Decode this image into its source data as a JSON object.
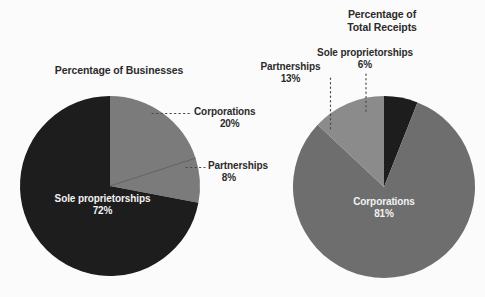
{
  "chart_data": [
    {
      "type": "pie",
      "title": "Percentage of Businesses",
      "categories": [
        "Corporations",
        "Partnerships",
        "Sole proprietorships"
      ],
      "values": [
        20,
        8,
        72
      ],
      "value_labels": [
        "20%",
        "8%",
        "72%"
      ],
      "colors": [
        "#7b7b7b",
        "#7b7b7b",
        "#1d1d1d"
      ],
      "start_angle_deg": 0,
      "direction": "clockwise",
      "legend": "none",
      "label_placement": [
        "callout",
        "callout",
        "inside"
      ]
    },
    {
      "type": "pie",
      "title": "Percentage of\nTotal Receipts",
      "categories": [
        "Sole proprietorships",
        "Corporations",
        "Partnerships"
      ],
      "values": [
        6,
        81,
        13
      ],
      "value_labels": [
        "6%",
        "81%",
        "13%"
      ],
      "colors": [
        "#1d1d1d",
        "#6e6e6e",
        "#8b8b8b"
      ],
      "start_angle_deg": 0,
      "direction": "clockwise",
      "legend": "none",
      "label_placement": [
        "callout",
        "inside",
        "callout"
      ]
    }
  ],
  "left_chart": {
    "title": "Percentage of Businesses",
    "callout_corporations": {
      "name": "Corporations",
      "value": "20%"
    },
    "callout_partnerships": {
      "name": "Partnerships",
      "value": "8%"
    },
    "inner_sole": {
      "name": "Sole proprietorships",
      "value": "72%"
    }
  },
  "right_chart": {
    "title_line1": "Percentage of",
    "title_line2": "Total Receipts",
    "callout_sole": {
      "name": "Sole proprietorships",
      "value": "6%"
    },
    "callout_partnerships": {
      "name": "Partnerships",
      "value": "13%"
    },
    "inner_corporations": {
      "name": "Corporations",
      "value": "81%"
    }
  },
  "palette": {
    "background": "#fbfbfb",
    "dark_slice": "#1d1d1d",
    "gray_slice": "#7b7b7b",
    "light_gray_slice": "#8b8b8b",
    "text_dark": "#2b2b2b",
    "text_light": "#f2f2f2",
    "leader_line": "#4a4a4a"
  }
}
